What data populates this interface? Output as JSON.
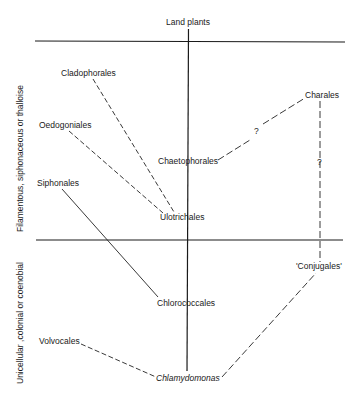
{
  "diagram": {
    "title_top": "Land plants",
    "zones": {
      "upper": "Filamentous, siphonaceous or thalloise",
      "lower": "Unicellular ,colonial or coenobial"
    },
    "nodes": {
      "land_plants": "Land plants",
      "cladophorales": "Cladophorales",
      "oedogoniales": "Oedogoniales",
      "siphonales": "Siphonales",
      "chaetophorales": "Chaetophorales",
      "ulotrichales": "Ulotrichales",
      "charales": "Charales",
      "conjugales": "'Conjugales'",
      "chlorococcales": "Chlorococcales",
      "volvocales": "Volvocales",
      "chlamydomonas": "Chlamydomonas"
    },
    "uncertain_markers": {
      "chaeto_charales": "?",
      "charales_conjugales": "?"
    },
    "edges": [
      {
        "from": "Chlamydomonas",
        "to": "Chlorococcales",
        "style": "solid"
      },
      {
        "from": "Chlorococcales",
        "to": "Ulotrichales",
        "style": "solid"
      },
      {
        "from": "Ulotrichales",
        "to": "Chaetophorales",
        "style": "solid"
      },
      {
        "from": "Chaetophorales",
        "to": "Land plants",
        "style": "solid"
      },
      {
        "from": "Ulotrichales",
        "to": "Cladophorales",
        "style": "dashed"
      },
      {
        "from": "Ulotrichales",
        "to": "Oedogoniales",
        "style": "dashed"
      },
      {
        "from": "Chlorococcales",
        "to": "Siphonales",
        "style": "dashed"
      },
      {
        "from": "Chlamydomonas",
        "to": "Volvocales",
        "style": "dashed"
      },
      {
        "from": "Chlamydomonas",
        "to": "'Conjugales'",
        "style": "dashed"
      },
      {
        "from": "'Conjugales'",
        "to": "Charales",
        "style": "dashed",
        "label": "?"
      },
      {
        "from": "Chaetophorales",
        "to": "Charales",
        "style": "dashed",
        "label": "?"
      }
    ]
  }
}
